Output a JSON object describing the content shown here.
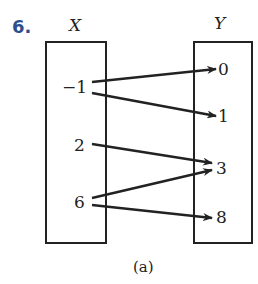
{
  "problem_number": "6.",
  "domain_set": {
    "label": "X",
    "elements": [
      "−1",
      "2",
      "6"
    ]
  },
  "codomain_set": {
    "label": "Y",
    "elements": [
      "0",
      "1",
      "3",
      "8"
    ]
  },
  "mappings": [
    {
      "from": "−1",
      "to": "0"
    },
    {
      "from": "−1",
      "to": "1"
    },
    {
      "from": "2",
      "to": "3"
    },
    {
      "from": "6",
      "to": "3"
    },
    {
      "from": "6",
      "to": "8"
    }
  ],
  "caption": "(a)"
}
